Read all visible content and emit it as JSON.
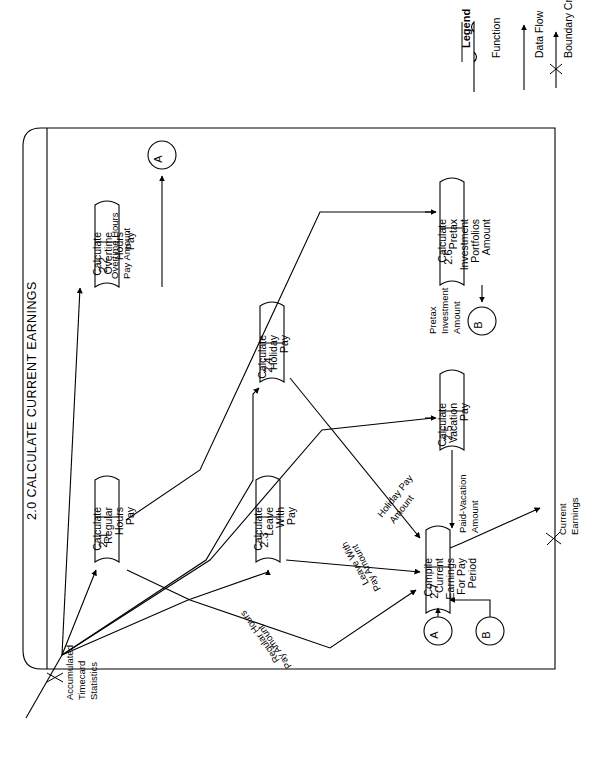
{
  "diagram": {
    "title": "2.0  CALCULATE CURRENT EARNINGS",
    "type": "data-flow-diagram",
    "orientation": "rotated-90-counterclockwise",
    "boundary_name": "system-boundary"
  },
  "legend": {
    "heading": "Legend",
    "items": [
      {
        "label": "Function",
        "icon": "function-shape-icon"
      },
      {
        "label": "Data Flow",
        "icon": "arrow-icon"
      },
      {
        "label": "Boundary Crossing",
        "icon": "boundary-crossing-icon"
      }
    ]
  },
  "functions": [
    {
      "id": "2.1",
      "name": "Calculate\nRegular\nHours\nPay",
      "lines": [
        "Calculate",
        "Regular",
        "Hours",
        "Pay"
      ]
    },
    {
      "id": "2.2",
      "name": "Calculate\nOvertime\nHours\nPay",
      "lines": [
        "Calculate",
        "Overtime",
        "Hours",
        "Pay"
      ]
    },
    {
      "id": "2.3",
      "name": "Calculate\nLeave\nWith\nPay",
      "lines": [
        "Calculate",
        "Leave",
        "With",
        "Pay"
      ]
    },
    {
      "id": "2.4",
      "name": "Calculate\nHoliday\nPay",
      "lines": [
        "Calculate",
        "Holiday",
        "Pay"
      ]
    },
    {
      "id": "2.5",
      "name": "Calculate\nVacation\nPay",
      "lines": [
        "Calculate",
        "Vacation",
        "Pay"
      ]
    },
    {
      "id": "2.6",
      "name": "Calculate\nPretax\nInvestment\nPortfolios\nAmount",
      "lines": [
        "Calculate",
        "Pretax",
        "Investment",
        "Portfolios",
        "Amount"
      ]
    },
    {
      "id": "2.7",
      "name": "Compile\nCurrent\nEarnings\nFor Pay\nPeriod",
      "lines": [
        "Compile",
        "Current",
        "Earnings",
        "For Pay",
        "Period"
      ]
    }
  ],
  "connectors": [
    {
      "id": "A",
      "role": "offpage-connector"
    },
    {
      "id": "B",
      "role": "offpage-connector"
    },
    {
      "id": "A2",
      "label": "A",
      "role": "offpage-connector"
    },
    {
      "id": "B2",
      "label": "B",
      "role": "offpage-connector"
    }
  ],
  "flows": [
    {
      "label": "Accumulated\nTimecard\nStatistics",
      "lines": [
        "Accumulated",
        "Timecard",
        "Statistics"
      ],
      "crossing": true
    },
    {
      "label": "Overtime Hours\nPay Amount",
      "lines": [
        "Overtime Hours",
        "Pay Amount"
      ],
      "crossing": false
    },
    {
      "label": "Pretax\nInvestment\nAmount",
      "lines": [
        "Pretax",
        "Investment",
        "Amount"
      ],
      "crossing": false
    },
    {
      "label": "Paid-Vacation\nAmount",
      "lines": [
        "Paid-Vacation",
        "Amount"
      ],
      "crossing": false
    },
    {
      "label": "Holiday Pay\nAmount",
      "lines": [
        "Holiday Pay",
        "Amount"
      ],
      "crossing": false
    },
    {
      "label": "Leave With\nPay Amount",
      "lines": [
        "Leave With",
        "Pay Amount"
      ],
      "crossing": false
    },
    {
      "label": "Regular Hours\nPay Amount",
      "lines": [
        "Regular Hours",
        "Pay Amount"
      ],
      "crossing": false
    },
    {
      "label": "Current\nEarnings",
      "lines": [
        "Current",
        "Earnings"
      ],
      "crossing": true
    }
  ],
  "labels": {
    "accumulated_1": "Accumulated",
    "accumulated_2": "Timecard",
    "accumulated_3": "Statistics",
    "overtime_1": "Overtime Hours",
    "overtime_2": "Pay Amount",
    "pretax_1": "Pretax",
    "pretax_2": "Investment",
    "pretax_3": "Amount",
    "vac_1": "Paid-Vacation",
    "vac_2": "Amount",
    "hol_1": "Holiday Pay",
    "hol_2": "Amount",
    "leave_1": "Leave With",
    "leave_2": "Pay Amount",
    "reg_1": "Regular Hours",
    "reg_2": "Pay Amount",
    "cur_1": "Current",
    "cur_2": "Earnings"
  }
}
